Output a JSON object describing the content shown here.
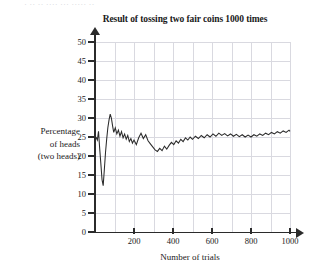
{
  "page": {
    "top_clipped_text": "· ·· ·· ···· ··· ····· ··",
    "background_color": "#ffffff"
  },
  "chart_data": {
    "type": "line",
    "title": "Result of tossing two fair coins 1000 times",
    "xlabel": "Number of trials",
    "ylabel": "Percentage of heads (two heads)",
    "ylabel_lines": [
      "Percentage",
      "of heads",
      "(two heads)"
    ],
    "xlim": [
      0,
      1000
    ],
    "ylim": [
      0,
      50
    ],
    "grid": true,
    "grid_x_step": 100,
    "grid_y_step": 5,
    "legend": null,
    "legend_position": "none",
    "line_color": "#2b2b2b",
    "axis_color": "#2b2b2b",
    "grid_color": "#d9d9e0",
    "xticks": [
      200,
      400,
      600,
      800,
      1000
    ],
    "xtick_labels": [
      "200",
      "400",
      "600",
      "800",
      "1000"
    ],
    "yticks": [
      0,
      5,
      10,
      15,
      20,
      25,
      30,
      35,
      40,
      45,
      50
    ],
    "ytick_labels": [
      "0",
      "5",
      "10",
      "15",
      "20",
      "25",
      "30",
      "35",
      "40",
      "45",
      "50"
    ],
    "series": [
      {
        "name": "Percentage of two heads",
        "x": [
          5,
          12,
          18,
          24,
          30,
          36,
          42,
          48,
          54,
          60,
          66,
          72,
          78,
          84,
          90,
          96,
          104,
          112,
          120,
          128,
          136,
          144,
          152,
          160,
          168,
          176,
          184,
          192,
          200,
          212,
          224,
          236,
          248,
          260,
          272,
          284,
          296,
          308,
          320,
          332,
          344,
          356,
          368,
          380,
          392,
          404,
          416,
          428,
          440,
          452,
          464,
          476,
          488,
          500,
          515,
          530,
          545,
          560,
          575,
          590,
          605,
          620,
          635,
          650,
          665,
          680,
          695,
          710,
          725,
          740,
          755,
          770,
          785,
          800,
          815,
          830,
          845,
          860,
          875,
          890,
          905,
          920,
          935,
          950,
          965,
          980,
          995,
          1000
        ],
        "y": [
          25.0,
          24.2,
          26.5,
          22.0,
          18.0,
          13.8,
          12.2,
          16.5,
          21.0,
          24.5,
          27.5,
          29.5,
          31.0,
          30.0,
          28.0,
          26.2,
          27.4,
          25.8,
          26.8,
          25.2,
          26.4,
          24.8,
          25.8,
          24.4,
          25.4,
          23.8,
          24.6,
          23.4,
          24.2,
          23.0,
          24.8,
          26.0,
          24.6,
          25.6,
          24.0,
          23.2,
          22.4,
          21.6,
          21.2,
          22.0,
          21.4,
          22.6,
          21.8,
          22.8,
          23.6,
          23.0,
          24.0,
          23.4,
          24.4,
          23.8,
          24.8,
          24.2,
          25.0,
          24.4,
          25.2,
          24.6,
          25.4,
          24.8,
          25.6,
          25.0,
          25.8,
          25.2,
          26.0,
          25.4,
          25.9,
          25.3,
          25.8,
          25.2,
          25.7,
          25.1,
          25.6,
          25.0,
          25.5,
          25.0,
          25.6,
          25.2,
          25.8,
          25.4,
          26.0,
          25.6,
          26.2,
          25.8,
          26.4,
          26.0,
          26.6,
          26.2,
          26.8,
          26.5
        ]
      }
    ]
  }
}
